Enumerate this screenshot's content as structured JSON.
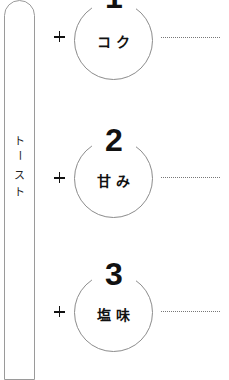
{
  "pill": {
    "label_chars": [
      "ト",
      "ー",
      "ス",
      "ト"
    ],
    "label": "トースト"
  },
  "items": [
    {
      "number": "1",
      "label": "コク",
      "operator": "+"
    },
    {
      "number": "2",
      "label": "甘み",
      "operator": "+"
    },
    {
      "number": "3",
      "label": "塩味",
      "operator": "+"
    }
  ],
  "colors": {
    "stroke": "#8c8c8c",
    "text": "#111111",
    "background": "#ffffff"
  }
}
